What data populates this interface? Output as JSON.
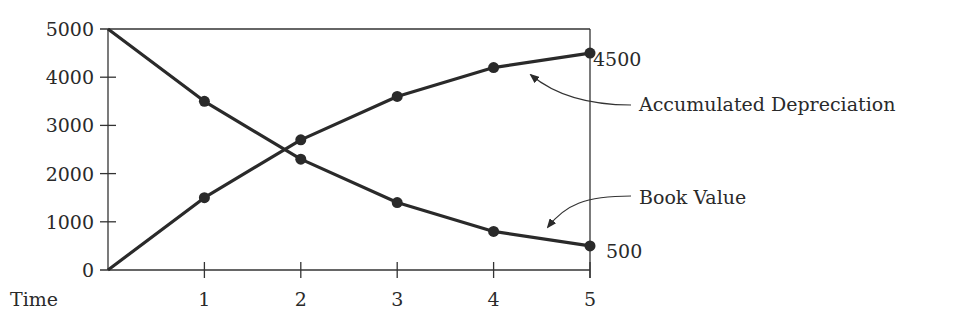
{
  "chart_data": {
    "type": "line",
    "title": "",
    "xlabel": "Time",
    "ylabel": "",
    "x": [
      0,
      1,
      2,
      3,
      4,
      5
    ],
    "x_tick_labels": [
      "1",
      "2",
      "3",
      "4",
      "5"
    ],
    "y_tick_labels": [
      "0",
      "1000",
      "2000",
      "3000",
      "4000",
      "5000"
    ],
    "ylim": [
      0,
      5000
    ],
    "xlim": [
      0,
      5
    ],
    "grid": false,
    "series": [
      {
        "name": "Book Value",
        "values": [
          5000,
          3500,
          2300,
          1400,
          800,
          500
        ],
        "end_label": "500"
      },
      {
        "name": "Accumulated Depreciation",
        "values": [
          0,
          1500,
          2700,
          3600,
          4200,
          4500
        ],
        "end_label": "4500"
      }
    ],
    "annotations": [
      {
        "text": "Accumulated Depreciation",
        "points_to": "Accumulated Depreciation"
      },
      {
        "text": "Book Value",
        "points_to": "Book Value"
      }
    ],
    "colors": {
      "line": "#2a2a2a",
      "axis": "#333333",
      "background": "#ffffff"
    }
  }
}
